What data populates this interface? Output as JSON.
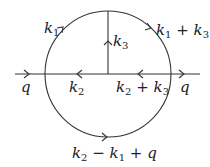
{
  "diagram": {
    "type": "feynman-diagram",
    "external_lines": {
      "left": {
        "label": "q",
        "direction": "right"
      },
      "right": {
        "label": "q",
        "direction": "right"
      }
    },
    "propagators": [
      {
        "id": "upper-left-arc",
        "label_main": "k",
        "label_sub": "1",
        "direction": "clockwise"
      },
      {
        "id": "upper-right-arc",
        "label_main": "k",
        "label_sub": "1",
        "label_op": "+",
        "label_main2": "k",
        "label_sub2": "3",
        "direction": "clockwise"
      },
      {
        "id": "vertical-line",
        "label_main": "k",
        "label_sub": "3",
        "direction": "up"
      },
      {
        "id": "left-horizontal",
        "label_main": "k",
        "label_sub": "2",
        "direction": "left"
      },
      {
        "id": "right-horizontal",
        "label_main": "k",
        "label_sub": "2",
        "label_op": "+",
        "label_main2": "k",
        "label_sub2": "3",
        "direction": "left"
      },
      {
        "id": "bottom-arc",
        "label": "k2 − k1 + q",
        "direction": "right"
      }
    ],
    "labels": {
      "q_left": "q",
      "q_right": "q",
      "k1": {
        "main": "k",
        "sub": "1"
      },
      "k1_plus_k3": {
        "a": "k",
        "a_sub": "1",
        "op": " + ",
        "b": "k",
        "b_sub": "3"
      },
      "k3": {
        "main": "k",
        "sub": "3"
      },
      "k2": {
        "main": "k",
        "sub": "2"
      },
      "k2_plus_k3": {
        "a": "k",
        "a_sub": "2",
        "op": " + ",
        "b": "k",
        "b_sub": "3"
      },
      "bottom": {
        "a": "k",
        "a_sub": "2",
        "op1": " − ",
        "b": "k",
        "b_sub": "1",
        "op2": " + ",
        "c": "q"
      }
    },
    "colors": {
      "line": "#333333",
      "text": "#222222",
      "background": "#ffffff"
    }
  }
}
